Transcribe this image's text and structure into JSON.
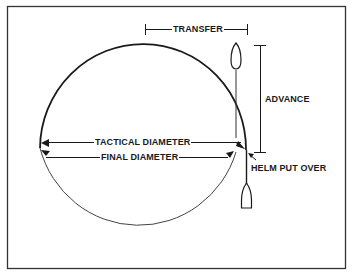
{
  "diagram": {
    "labels": {
      "transfer": "TRANSFER",
      "advance": "ADVANCE",
      "tactical_diameter": "TACTICAL DIAMETER",
      "final_diameter": "FINAL DIAMETER",
      "helm_put_over": "HELM PUT OVER"
    },
    "colors": {
      "line": "#1a1a1a",
      "frame": "#333333",
      "background": "#ffffff"
    },
    "icons": {
      "ship_top": "ship-hull-icon",
      "ship_bottom": "ship-hull-icon"
    }
  }
}
